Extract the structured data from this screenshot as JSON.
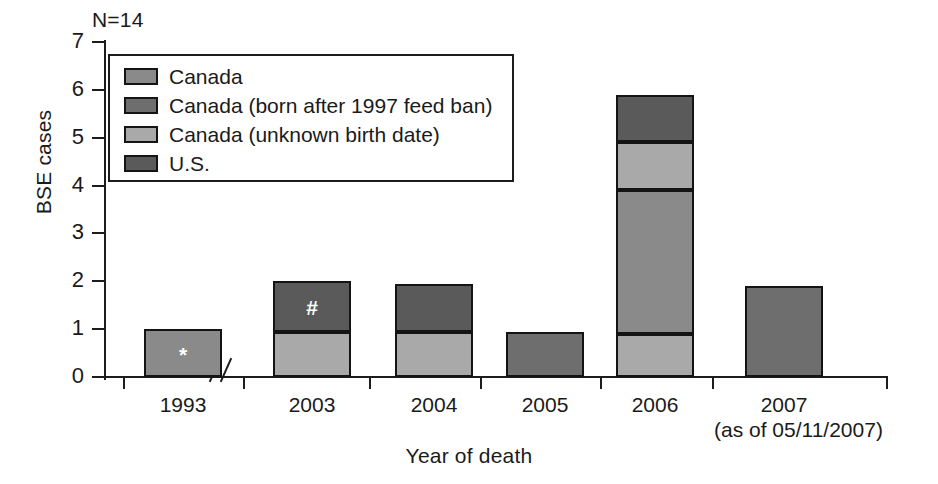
{
  "chart_data": {
    "type": "bar",
    "subtype": "stacked-bar",
    "title": "",
    "annotation": "N=14",
    "xlabel": "Year of death",
    "ylabel": "BSE cases",
    "ylim": [
      0,
      7
    ],
    "yticks": [
      0,
      1,
      2,
      3,
      4,
      5,
      6,
      7
    ],
    "ytick_labels": [
      "0",
      "1",
      "2",
      "3",
      "4",
      "5",
      "6",
      "7"
    ],
    "grid": false,
    "axis_break": true,
    "axis_break_between": [
      "1993",
      "2003"
    ],
    "legend_position": "upper-left-inside",
    "categories": [
      "1993",
      "2003",
      "2004",
      "2005",
      "2006",
      "2007"
    ],
    "category_sublabels": [
      "",
      "",
      "",
      "",
      "",
      "(as of 05/11/2007)"
    ],
    "series": [
      {
        "name": "Canada",
        "color": "#8a8a8a",
        "values": [
          1.0,
          0,
          0,
          0.95,
          3.0,
          1.9
        ]
      },
      {
        "name": "Canada (born after 1997 feed ban)",
        "color": "#6e6e6e",
        "values": [
          0,
          0,
          0,
          0,
          0,
          0
        ]
      },
      {
        "name": "Canada (unknown birth date)",
        "color": "#a9a9a9",
        "values": [
          0,
          0.95,
          0.95,
          0,
          0.9,
          0
        ]
      },
      {
        "name": "U.S.",
        "color": "#5a5a5a",
        "values": [
          0,
          1.05,
          1.0,
          0,
          1.0,
          0
        ]
      }
    ],
    "bars": [
      {
        "category": "1993",
        "total": 1.0,
        "segments": [
          {
            "series": "Canada",
            "value": 1.0,
            "from": 0,
            "to": 1.0,
            "color": "#8a8a8a",
            "marker": "*"
          }
        ]
      },
      {
        "category": "2003",
        "total": 2.0,
        "segments": [
          {
            "series": "Canada (unknown birth date)",
            "value": 0.95,
            "from": 0,
            "to": 0.95,
            "color": "#a9a9a9",
            "marker": ""
          },
          {
            "series": "U.S.",
            "value": 1.05,
            "from": 0.95,
            "to": 2.0,
            "color": "#5a5a5a",
            "marker": "#"
          }
        ]
      },
      {
        "category": "2004",
        "total": 1.95,
        "segments": [
          {
            "series": "Canada (unknown birth date)",
            "value": 0.95,
            "from": 0,
            "to": 0.95,
            "color": "#a9a9a9",
            "marker": ""
          },
          {
            "series": "U.S.",
            "value": 1.0,
            "from": 0.95,
            "to": 1.95,
            "color": "#5a5a5a",
            "marker": ""
          }
        ]
      },
      {
        "category": "2005",
        "total": 0.95,
        "segments": [
          {
            "series": "Canada",
            "value": 0.95,
            "from": 0,
            "to": 0.95,
            "color": "#6e6e6e",
            "marker": ""
          }
        ]
      },
      {
        "category": "2006",
        "total": 5.9,
        "segments": [
          {
            "series": "Canada (unknown birth date)",
            "value": 0.9,
            "from": 0,
            "to": 0.9,
            "color": "#a9a9a9",
            "marker": ""
          },
          {
            "series": "Canada (born after 1997 feed ban)",
            "value": 3.0,
            "from": 0.9,
            "to": 3.9,
            "color": "#8a8a8a",
            "marker": ""
          },
          {
            "series": "Canada (unknown birth date)",
            "value": 1.0,
            "from": 3.9,
            "to": 4.9,
            "color": "#a9a9a9",
            "marker": ""
          },
          {
            "series": "U.S.",
            "value": 1.0,
            "from": 4.9,
            "to": 5.9,
            "color": "#5a5a5a",
            "marker": ""
          }
        ]
      },
      {
        "category": "2007",
        "total": 1.9,
        "segments": [
          {
            "series": "Canada (born after 1997 feed ban)",
            "value": 1.9,
            "from": 0,
            "to": 1.9,
            "color": "#6e6e6e",
            "marker": ""
          }
        ]
      }
    ],
    "legend": [
      {
        "label": "Canada",
        "color": "#8a8a8a"
      },
      {
        "label": "Canada (born after 1997 feed ban)",
        "color": "#6e6e6e"
      },
      {
        "label": "Canada (unknown birth date)",
        "color": "#a9a9a9"
      },
      {
        "label": "U.S.",
        "color": "#5a5a5a"
      }
    ],
    "markers": [
      {
        "symbol": "*",
        "category": "1993"
      },
      {
        "symbol": "#",
        "category": "2003"
      }
    ]
  },
  "colors": {
    "axis": "#1c1c1c",
    "background": "#ffffff",
    "text": "#1a1a1a"
  }
}
